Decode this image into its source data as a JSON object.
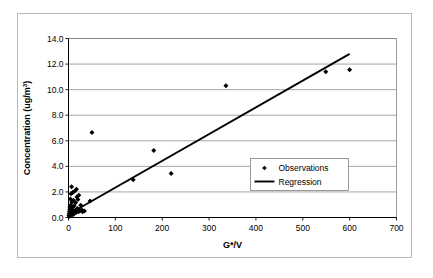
{
  "chart_data": {
    "type": "scatter",
    "title": "",
    "xlabel": "G*/V",
    "ylabel": "Concentration (ug/m3)",
    "ylabel_base": "Concentration (ug/m",
    "ylabel_sup": "3",
    "ylabel_tail": ")",
    "xlim": [
      0,
      700
    ],
    "ylim": [
      0,
      14
    ],
    "xticks": [
      0,
      100,
      200,
      300,
      400,
      500,
      600,
      700
    ],
    "xtick_labels": [
      "0",
      "100",
      "200",
      "300",
      "400",
      "500",
      "600",
      "700"
    ],
    "yticks": [
      0,
      2,
      4,
      6,
      8,
      10,
      12,
      14
    ],
    "ytick_labels": [
      "0.0",
      "2.0",
      "4.0",
      "6.0",
      "8.0",
      "10.0",
      "12.0",
      "14.0"
    ],
    "grid": "horizontal",
    "legend_position": "inside-right",
    "series": [
      {
        "name": "Observations",
        "type": "scatter",
        "marker": "diamond",
        "color": "#000000",
        "points": [
          [
            1,
            0.15
          ],
          [
            1.5,
            0.3
          ],
          [
            2,
            0.45
          ],
          [
            2,
            0.1
          ],
          [
            2.5,
            0.6
          ],
          [
            3,
            0.2
          ],
          [
            3,
            0.85
          ],
          [
            3.5,
            0.35
          ],
          [
            4,
            1.45
          ],
          [
            4,
            0.55
          ],
          [
            4.5,
            0.25
          ],
          [
            5,
            0.95
          ],
          [
            5,
            0.4
          ],
          [
            5.5,
            1.85
          ],
          [
            6,
            0.7
          ],
          [
            6,
            0.3
          ],
          [
            6.5,
            2.4
          ],
          [
            7,
            1.2
          ],
          [
            7,
            0.5
          ],
          [
            7.5,
            0.2
          ],
          [
            8,
            0.8
          ],
          [
            8.5,
            0.35
          ],
          [
            9,
            1.95
          ],
          [
            9,
            0.6
          ],
          [
            10,
            0.45
          ],
          [
            10.5,
            1.35
          ],
          [
            11,
            0.25
          ],
          [
            12,
            0.9
          ],
          [
            13,
            2.05
          ],
          [
            14,
            0.55
          ],
          [
            15,
            1.15
          ],
          [
            16,
            0.4
          ],
          [
            17,
            2.2
          ],
          [
            18,
            1.6
          ],
          [
            19,
            0.7
          ],
          [
            20,
            1.4
          ],
          [
            21,
            0.45
          ],
          [
            22,
            1.75
          ],
          [
            24,
            0.5
          ],
          [
            26,
            0.95
          ],
          [
            28,
            0.6
          ],
          [
            30,
            0.45
          ],
          [
            34,
            0.5
          ],
          [
            46,
            1.3
          ],
          [
            50,
            6.65
          ],
          [
            138,
            2.95
          ],
          [
            182,
            5.25
          ],
          [
            219,
            3.45
          ],
          [
            336,
            10.3
          ],
          [
            549,
            11.4
          ],
          [
            600,
            11.55
          ]
        ]
      },
      {
        "name": "Regression",
        "type": "line",
        "color": "#000000",
        "x_start": 5,
        "y_start": 0.35,
        "x_end": 600,
        "y_end": 12.8
      }
    ],
    "legend_entries": [
      {
        "label": "Observations",
        "marker": "diamond"
      },
      {
        "label": "Regression",
        "marker": "line"
      }
    ]
  }
}
